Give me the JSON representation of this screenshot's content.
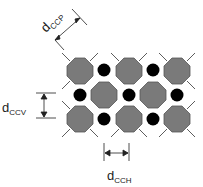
{
  "diagram": {
    "labels": {
      "ccp": {
        "main": "d",
        "sub": "CCP"
      },
      "ccv": {
        "main": "d",
        "sub": "CCV"
      },
      "cch": {
        "main": "d",
        "sub": "CCH"
      }
    },
    "colors": {
      "octagon_fill": "#7a7a7a",
      "octagon_stroke": "#555555",
      "circle_fill": "#000000",
      "line": "#333333"
    },
    "octagons": [
      {
        "cx": 80,
        "cy": 71
      },
      {
        "cx": 129,
        "cy": 71
      },
      {
        "cx": 177,
        "cy": 71
      },
      {
        "cx": 104,
        "cy": 95
      },
      {
        "cx": 153,
        "cy": 95
      },
      {
        "cx": 80,
        "cy": 119
      },
      {
        "cx": 129,
        "cy": 119
      },
      {
        "cx": 177,
        "cy": 119
      }
    ],
    "circles": [
      {
        "cx": 104,
        "cy": 70
      },
      {
        "cx": 153,
        "cy": 70
      },
      {
        "cx": 80,
        "cy": 95
      },
      {
        "cx": 129,
        "cy": 95
      },
      {
        "cx": 177,
        "cy": 95
      },
      {
        "cx": 104,
        "cy": 119
      },
      {
        "cx": 153,
        "cy": 119
      }
    ]
  }
}
